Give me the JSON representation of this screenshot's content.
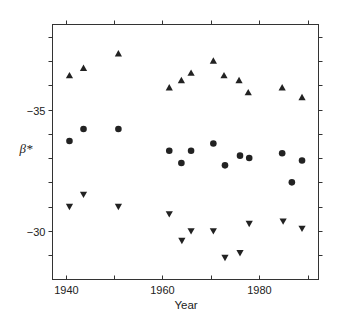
{
  "chart_data": {
    "type": "scatter",
    "title": "",
    "xlabel": "Year",
    "ylabel": "β*",
    "xlim": [
      1937.3,
      1992.2
    ],
    "ylim": [
      -38.5,
      -28.0
    ],
    "y_inverted": true,
    "grid": false,
    "legend": "none",
    "x_ticks": [
      1940,
      1950,
      1960,
      1970,
      1980,
      1990
    ],
    "x_tick_labels": [
      "1940",
      "",
      "1960",
      "",
      "1980",
      ""
    ],
    "y_ticks": [
      -38,
      -37,
      -36,
      -35,
      -34,
      -33,
      -32,
      -31,
      -30,
      -29
    ],
    "y_tick_labels": [
      "",
      "",
      "",
      "−35",
      "",
      "",
      "",
      "",
      "−30",
      ""
    ],
    "series": [
      {
        "name": "upper",
        "marker": "triangle-up",
        "points": [
          {
            "x": 1940.8,
            "y": -36.4
          },
          {
            "x": 1943.7,
            "y": -36.7
          },
          {
            "x": 1950.9,
            "y": -37.3
          },
          {
            "x": 1961.4,
            "y": -35.9
          },
          {
            "x": 1963.9,
            "y": -36.2
          },
          {
            "x": 1965.9,
            "y": -36.5
          },
          {
            "x": 1970.5,
            "y": -37.0
          },
          {
            "x": 1972.7,
            "y": -36.4
          },
          {
            "x": 1975.8,
            "y": -36.2
          },
          {
            "x": 1977.7,
            "y": -35.7
          },
          {
            "x": 1984.7,
            "y": -35.9
          },
          {
            "x": 1988.8,
            "y": -35.5
          }
        ]
      },
      {
        "name": "middle",
        "marker": "circle",
        "points": [
          {
            "x": 1940.8,
            "y": -33.7
          },
          {
            "x": 1943.7,
            "y": -34.2
          },
          {
            "x": 1950.9,
            "y": -34.2
          },
          {
            "x": 1961.4,
            "y": -33.3
          },
          {
            "x": 1963.9,
            "y": -32.8
          },
          {
            "x": 1965.9,
            "y": -33.3
          },
          {
            "x": 1970.5,
            "y": -33.6
          },
          {
            "x": 1972.9,
            "y": -32.7
          },
          {
            "x": 1976.0,
            "y": -33.1
          },
          {
            "x": 1977.9,
            "y": -33.0
          },
          {
            "x": 1984.7,
            "y": -33.2
          },
          {
            "x": 1986.7,
            "y": -32.0
          },
          {
            "x": 1988.8,
            "y": -32.9
          }
        ]
      },
      {
        "name": "lower",
        "marker": "triangle-down",
        "points": [
          {
            "x": 1940.8,
            "y": -31.0
          },
          {
            "x": 1943.7,
            "y": -31.5
          },
          {
            "x": 1950.9,
            "y": -31.0
          },
          {
            "x": 1961.4,
            "y": -30.7
          },
          {
            "x": 1964.0,
            "y": -29.6
          },
          {
            "x": 1965.9,
            "y": -30.0
          },
          {
            "x": 1970.5,
            "y": -30.0
          },
          {
            "x": 1972.9,
            "y": -28.9
          },
          {
            "x": 1976.0,
            "y": -29.1
          },
          {
            "x": 1977.9,
            "y": -30.3
          },
          {
            "x": 1984.9,
            "y": -30.4
          },
          {
            "x": 1988.8,
            "y": -30.1
          }
        ]
      }
    ]
  }
}
